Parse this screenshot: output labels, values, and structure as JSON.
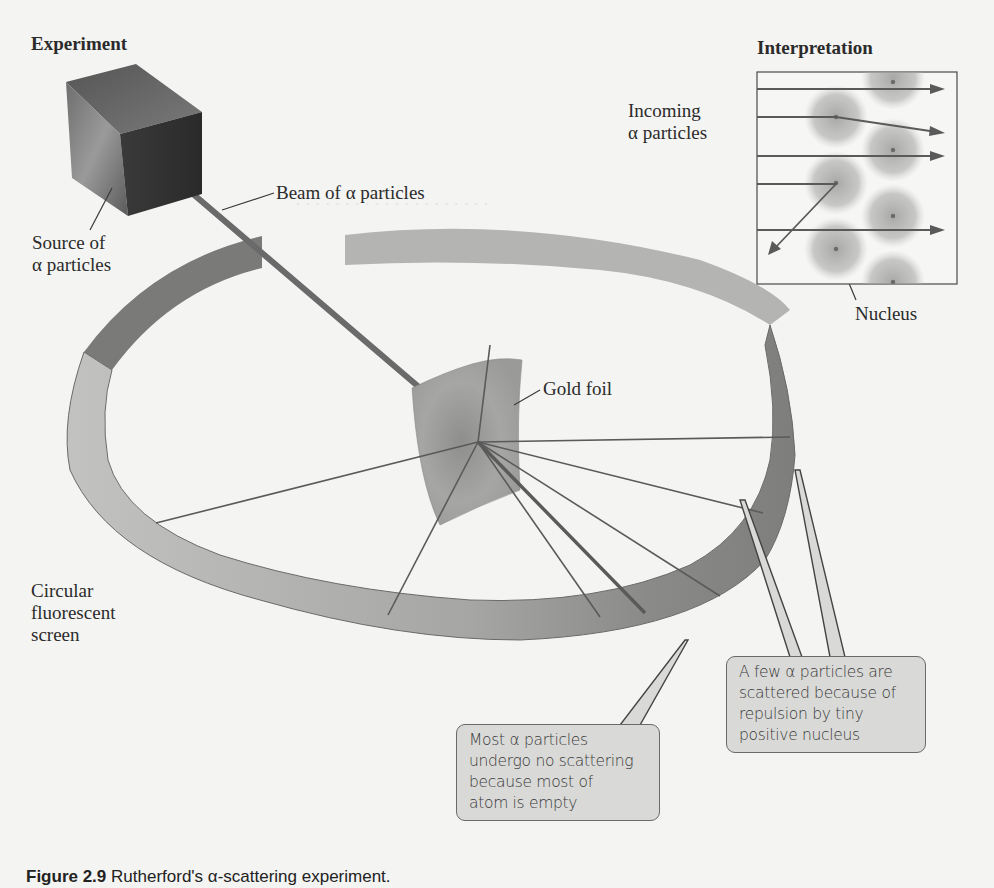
{
  "figure": {
    "headings": {
      "experiment": "Experiment",
      "interpretation": "Interpretation"
    },
    "labels": {
      "source": [
        "Source of",
        "α particles"
      ],
      "beam": "Beam of α particles",
      "gold_foil": "Gold foil",
      "screen": [
        "Circular",
        "fluorescent",
        "screen"
      ],
      "incoming": [
        "Incoming",
        "α particles"
      ],
      "nucleus": "Nucleus"
    },
    "callouts": {
      "scattered": [
        "A few α particles are",
        "scattered because of",
        "repulsion by tiny",
        "positive nucleus"
      ],
      "no_scatter": [
        "Most α particles",
        "undergo no scattering",
        "because most of",
        "atom is empty"
      ]
    },
    "caption": {
      "number": "Figure 2.9",
      "text": "Rutherford's α-scattering experiment."
    }
  },
  "colors": {
    "background": "#f4f4f2",
    "ring": "#b8b8b6",
    "ring_dark": "#8a8a88",
    "callout_fill": "#d9d9d7",
    "line": "#555555"
  }
}
